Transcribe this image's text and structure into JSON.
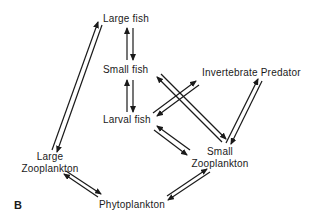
{
  "panel_label": "B",
  "nodes": {
    "large_fish": "Large fish",
    "small_fish": "Small fish",
    "larval_fish": "Larval fish",
    "invertebrate_predator": "Invertebrate Predator",
    "large_zooplankton_1": "Large",
    "large_zooplankton_2": "Zooplankton",
    "small_zooplankton_1": "Small",
    "small_zooplankton_2": "Zooplankton",
    "phytoplankton": "Phytoplankton"
  },
  "edges": [
    {
      "from": "Large fish",
      "to": "Small fish",
      "direction": "bidirectional"
    },
    {
      "from": "Small fish",
      "to": "Larval fish",
      "direction": "bidirectional"
    },
    {
      "from": "Large fish",
      "to": "Large Zooplankton",
      "direction": "bidirectional"
    },
    {
      "from": "Small fish",
      "to": "Small Zooplankton",
      "direction": "bidirectional"
    },
    {
      "from": "Invertebrate Predator",
      "to": "Larval fish",
      "direction": "bidirectional"
    },
    {
      "from": "Invertebrate Predator",
      "to": "Small Zooplankton",
      "direction": "bidirectional"
    },
    {
      "from": "Larval fish",
      "to": "Small Zooplankton",
      "direction": "bidirectional"
    },
    {
      "from": "Large Zooplankton",
      "to": "Phytoplankton",
      "direction": "bidirectional"
    },
    {
      "from": "Small Zooplankton",
      "to": "Phytoplankton",
      "direction": "bidirectional"
    }
  ]
}
